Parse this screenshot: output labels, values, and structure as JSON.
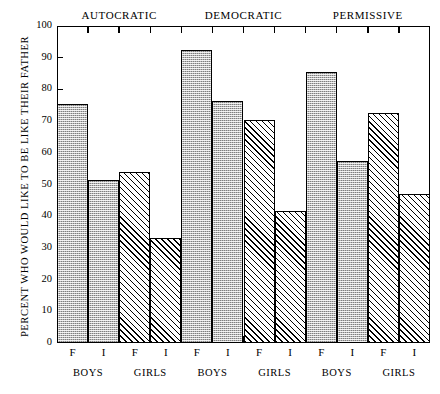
{
  "chart_data": {
    "type": "bar",
    "title": "",
    "xlabel": "",
    "ylabel": "PERCENT WHO WOULD LIKE TO BE LIKE THEIR FATHER",
    "ylim": [
      0,
      100
    ],
    "yticks": [
      0,
      10,
      20,
      30,
      40,
      50,
      60,
      70,
      80,
      90,
      100
    ],
    "ytick_labels": [
      "0",
      "10",
      "20",
      "30",
      "40",
      "50",
      "60",
      "70",
      "80",
      "90",
      "100"
    ],
    "grid": false,
    "legend": "none",
    "top_groups": [
      "AUTOCRATIC",
      "DEMOCRATIC",
      "PERMISSIVE"
    ],
    "sub_groups": [
      "BOYS",
      "GIRLS",
      "BOYS",
      "GIRLS",
      "BOYS",
      "GIRLS"
    ],
    "categories": [
      "F",
      "I",
      "F",
      "I",
      "F",
      "I",
      "F",
      "I",
      "F",
      "I",
      "F",
      "I"
    ],
    "values": [
      75.5,
      51.5,
      54.0,
      33.0,
      92.5,
      76.5,
      70.5,
      41.5,
      85.5,
      57.5,
      72.5,
      47.0
    ],
    "bars": [
      {
        "group": "AUTOCRATIC",
        "sub": "BOYS",
        "cat": "F",
        "value": 75.5,
        "fill": "dot"
      },
      {
        "group": "AUTOCRATIC",
        "sub": "BOYS",
        "cat": "I",
        "value": 51.5,
        "fill": "dot"
      },
      {
        "group": "AUTOCRATIC",
        "sub": "GIRLS",
        "cat": "F",
        "value": 54.0,
        "fill": "hatch"
      },
      {
        "group": "AUTOCRATIC",
        "sub": "GIRLS",
        "cat": "I",
        "value": 33.0,
        "fill": "hatch"
      },
      {
        "group": "DEMOCRATIC",
        "sub": "BOYS",
        "cat": "F",
        "value": 92.5,
        "fill": "dot"
      },
      {
        "group": "DEMOCRATIC",
        "sub": "BOYS",
        "cat": "I",
        "value": 76.5,
        "fill": "dot"
      },
      {
        "group": "DEMOCRATIC",
        "sub": "GIRLS",
        "cat": "F",
        "value": 70.5,
        "fill": "hatch"
      },
      {
        "group": "DEMOCRATIC",
        "sub": "GIRLS",
        "cat": "I",
        "value": 41.5,
        "fill": "hatch"
      },
      {
        "group": "PERMISSIVE",
        "sub": "BOYS",
        "cat": "F",
        "value": 85.5,
        "fill": "dot"
      },
      {
        "group": "PERMISSIVE",
        "sub": "BOYS",
        "cat": "I",
        "value": 57.5,
        "fill": "dot"
      },
      {
        "group": "PERMISSIVE",
        "sub": "GIRLS",
        "cat": "F",
        "value": 72.5,
        "fill": "hatch"
      },
      {
        "group": "PERMISSIVE",
        "sub": "GIRLS",
        "cat": "I",
        "value": 47.0,
        "fill": "hatch"
      }
    ],
    "colors": {
      "axis": "#000000",
      "bar_outline": "#000000",
      "dot_fill": "#b9b9b9",
      "hatch_fill": "#ffffff",
      "background": "#ffffff"
    }
  }
}
